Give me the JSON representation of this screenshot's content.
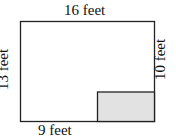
{
  "diagram": {
    "type": "floor-plan",
    "labels": {
      "top": "16 feet",
      "left": "13 feet",
      "right": "10 feet",
      "bottom": "9 feet"
    },
    "colors": {
      "outline": "#222222",
      "shaded": "#e2e2e2"
    }
  }
}
